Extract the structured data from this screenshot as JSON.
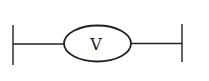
{
  "diagram": {
    "type": "circuit-symbol",
    "component": {
      "name": "voltmeter",
      "label": "V"
    },
    "terminals": [
      "left",
      "right"
    ],
    "colors": {
      "stroke": "#222222",
      "background": "#ffffff"
    }
  }
}
